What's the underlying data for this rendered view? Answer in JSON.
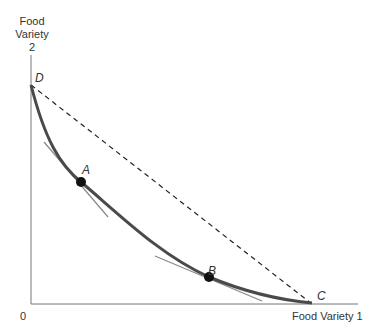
{
  "diagram": {
    "y_axis_label": [
      "Food",
      "Variety",
      "2"
    ],
    "x_axis_label": "Food Variety 1",
    "origin_label": "0",
    "points": {
      "D": "D",
      "A": "A",
      "B": "B",
      "C": "C"
    },
    "colors": {
      "curve": "#4a4a4a",
      "axis": "#666666",
      "dashed_line": "#222222",
      "tangent": "#777777",
      "dot": "#111111"
    }
  }
}
